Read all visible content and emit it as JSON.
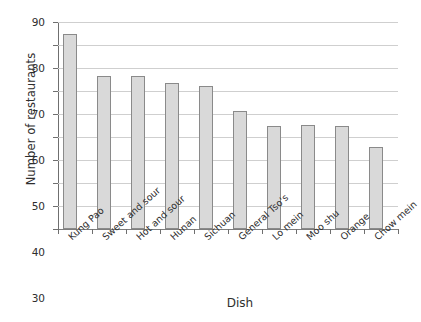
{
  "chart_data": {
    "type": "bar",
    "title": "",
    "xlabel": "Dish",
    "ylabel": "Number of restaurants",
    "categories": [
      "Kung Pao",
      "Sweet and sour",
      "Hot and sour",
      "Hunan",
      "Sichuan",
      "General Tso's",
      "Lo mein",
      "Moo shu",
      "Orange",
      "Chow mein"
    ],
    "values": [
      85,
      66.5,
      66.5,
      63.5,
      62,
      51.5,
      45,
      45.3,
      44.8,
      35.5
    ],
    "ylim": [
      0,
      90
    ],
    "ytick_labels": [
      "0",
      "10",
      "20",
      "30",
      "40",
      "50",
      "60",
      "70",
      "80",
      "90"
    ],
    "ytick_values": [
      0,
      10,
      20,
      30,
      40,
      50,
      60,
      70,
      80,
      90
    ],
    "grid": true,
    "legend": false,
    "orientation": "vertical",
    "bar_color": "#d9d9d9",
    "bar_border_color": "#8a8a8a",
    "gridline_color": "#cfcfcf",
    "axis_color": "#6f6f6f",
    "background_color": "#ffffff"
  }
}
